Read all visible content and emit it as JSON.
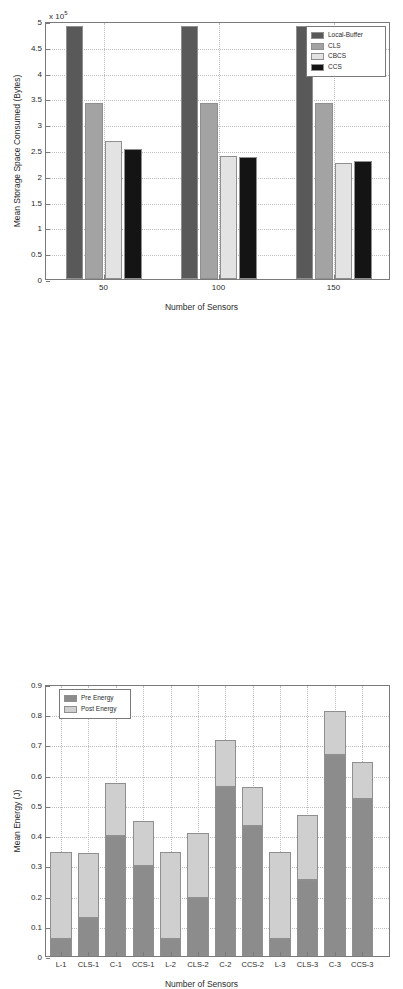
{
  "chart_data": [
    {
      "id": "storage",
      "type": "bar",
      "title": "",
      "xlabel": "Number of Sensors",
      "ylabel": "Mean Storage Space Consumed (Bytes)",
      "y_multiplier": "x 10",
      "y_multiplier_exp": "5",
      "categories": [
        "50",
        "100",
        "150"
      ],
      "ylim": [
        0,
        5
      ],
      "yticks": [
        "0",
        "0.5",
        "1",
        "1.5",
        "2",
        "2.5",
        "3",
        "3.5",
        "4",
        "4.5",
        "5"
      ],
      "ytick_values": [
        0,
        0.5,
        1,
        1.5,
        2,
        2.5,
        3,
        3.5,
        4,
        4.5,
        5
      ],
      "grid": true,
      "legend_position": "top-right",
      "series": [
        {
          "name": "Local-Buffer",
          "color": "#595959",
          "values": [
            4.9,
            4.9,
            4.9
          ]
        },
        {
          "name": "CLS",
          "color": "#a3a3a3",
          "values": [
            3.42,
            3.42,
            3.42
          ]
        },
        {
          "name": "CBCS",
          "color": "#e3e3e3",
          "values": [
            2.67,
            2.39,
            2.245
          ]
        },
        {
          "name": "CCS",
          "color": "#141414",
          "values": [
            2.52,
            2.37,
            2.28
          ]
        }
      ]
    },
    {
      "id": "energy",
      "type": "bar",
      "title": "",
      "xlabel": "Number of Sensors",
      "ylabel": "Mean Energy (J)",
      "categories": [
        "L-1",
        "CLS-1",
        "C-1",
        "CCS-1",
        "L-2",
        "CLS-2",
        "C-2",
        "CCS-2",
        "L-3",
        "CLS-3",
        "C-3",
        "CCS-3"
      ],
      "ylim": [
        0,
        0.9
      ],
      "yticks": [
        "0",
        "0.1",
        "0.2",
        "0.3",
        "0.4",
        "0.5",
        "0.6",
        "0.7",
        "0.8",
        "0.9"
      ],
      "ytick_values": [
        0,
        0.1,
        0.2,
        0.3,
        0.4,
        0.5,
        0.6,
        0.7,
        0.8,
        0.9
      ],
      "grid": true,
      "stacked": true,
      "legend_position": "top-left",
      "series": [
        {
          "name": "Pre Energy",
          "color": "#8c8c8c",
          "values": [
            0.056,
            0.125,
            0.396,
            0.299,
            0.056,
            0.192,
            0.558,
            0.43,
            0.056,
            0.25,
            0.664,
            0.521
          ]
        },
        {
          "name": "Post Energy",
          "color": "#cfcfcf",
          "values": [
            0.287,
            0.215,
            0.175,
            0.147,
            0.287,
            0.216,
            0.157,
            0.13,
            0.287,
            0.216,
            0.146,
            0.12
          ]
        }
      ],
      "totals": [
        0.343,
        0.34,
        0.571,
        0.446,
        0.343,
        0.408,
        0.715,
        0.56,
        0.343,
        0.466,
        0.81,
        0.641
      ]
    }
  ]
}
